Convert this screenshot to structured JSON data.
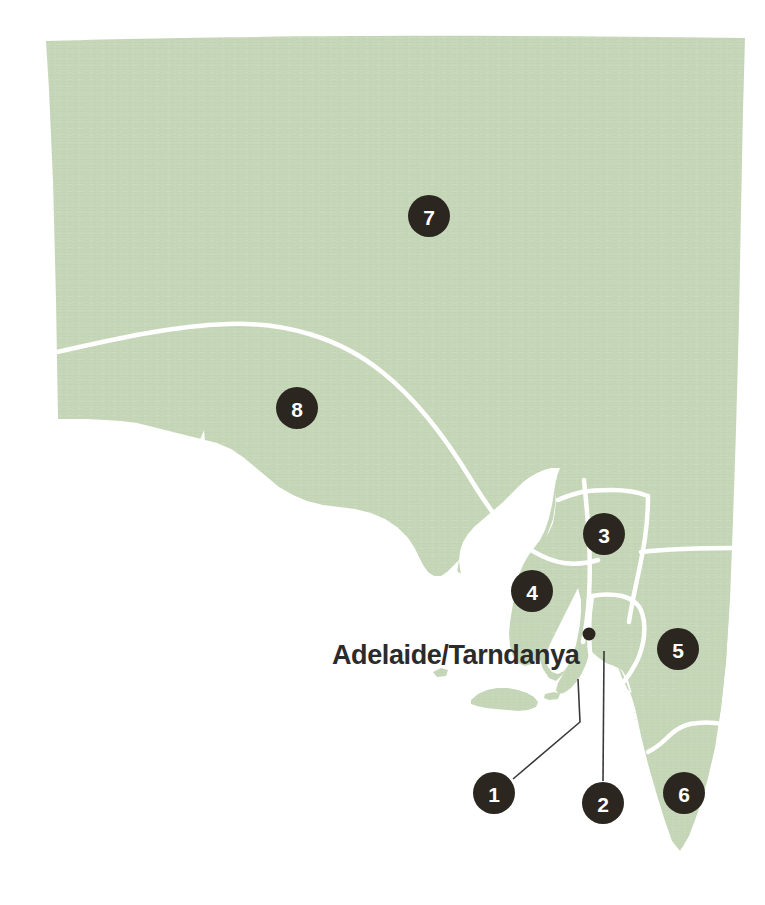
{
  "map": {
    "title": "South Australia regions reference map",
    "colors": {
      "land": "#c5d6b8",
      "land_texture": "#bccfae",
      "background": "#ffffff",
      "border": "#ffffff",
      "marker_fill": "#2b2620",
      "marker_label": "#ffffff",
      "city_label": "#2b2b2b",
      "leader_line": "#3a3a3a"
    },
    "city_labels": [
      {
        "id": "adelaide-tarndanya",
        "text": "Adelaide/Tarndanya",
        "x": 332,
        "y": 664,
        "dot_x": 589,
        "dot_y": 634,
        "dot_radius": 6.5
      }
    ],
    "markers": [
      {
        "id": "marker-1",
        "label": "1",
        "x": 494,
        "y": 793,
        "r": 21,
        "has_leader": true
      },
      {
        "id": "marker-2",
        "label": "2",
        "x": 603,
        "y": 803,
        "r": 21,
        "has_leader": true
      },
      {
        "id": "marker-3",
        "label": "3",
        "x": 604,
        "y": 534,
        "r": 21,
        "has_leader": false
      },
      {
        "id": "marker-4",
        "label": "4",
        "x": 532,
        "y": 591,
        "r": 21,
        "has_leader": false
      },
      {
        "id": "marker-5",
        "label": "5",
        "x": 678,
        "y": 649,
        "r": 21,
        "has_leader": false
      },
      {
        "id": "marker-6",
        "label": "6",
        "x": 684,
        "y": 793,
        "r": 21,
        "has_leader": false
      },
      {
        "id": "marker-7",
        "label": "7",
        "x": 429,
        "y": 216,
        "r": 21,
        "has_leader": false
      },
      {
        "id": "marker-8",
        "label": "8",
        "x": 297,
        "y": 408,
        "r": 21,
        "has_leader": false
      }
    ],
    "leader_lines": [
      {
        "id": "leader-1",
        "points": "513,779 580,722 578,679"
      },
      {
        "id": "leader-2",
        "points": "603,782 604,651"
      }
    ]
  }
}
